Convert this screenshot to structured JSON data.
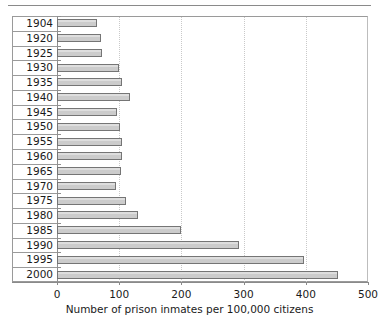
{
  "chart_data": {
    "type": "bar",
    "orientation": "horizontal",
    "title": "",
    "xlabel": "Number of prison inmates per 100,000 citizens",
    "ylabel": "",
    "xlim": [
      0,
      500
    ],
    "xticks": [
      0,
      100,
      200,
      300,
      400,
      500
    ],
    "xtick_labels": [
      "0",
      "100",
      "200",
      "300",
      "400",
      "500"
    ],
    "grid": "vertical-dotted",
    "gridlines": [
      100,
      200,
      300,
      400
    ],
    "legend": "none",
    "categories": [
      "1904",
      "1920",
      "1925",
      "1930",
      "1935",
      "1940",
      "1945",
      "1950",
      "1955",
      "1960",
      "1965",
      "1970",
      "1975",
      "1980",
      "1985",
      "1990",
      "1995",
      "2000"
    ],
    "values": [
      65,
      70,
      73,
      100,
      105,
      118,
      97,
      102,
      105,
      104,
      103,
      95,
      111,
      130,
      200,
      292,
      397,
      452
    ],
    "bar_color": "#cccccc",
    "bar_edge_color": "#757575"
  },
  "axis": {
    "x_label": "Number of prison inmates per 100,000 citizens",
    "ticks": [
      {
        "label": "0",
        "value": 0
      },
      {
        "label": "100",
        "value": 100
      },
      {
        "label": "200",
        "value": 200
      },
      {
        "label": "300",
        "value": 300
      },
      {
        "label": "400",
        "value": 400
      },
      {
        "label": "500",
        "value": 500
      }
    ]
  },
  "rows": [
    {
      "year": "1904",
      "value": 65
    },
    {
      "year": "1920",
      "value": 70
    },
    {
      "year": "1925",
      "value": 73
    },
    {
      "year": "1930",
      "value": 100
    },
    {
      "year": "1935",
      "value": 105
    },
    {
      "year": "1940",
      "value": 118
    },
    {
      "year": "1945",
      "value": 97
    },
    {
      "year": "1950",
      "value": 102
    },
    {
      "year": "1955",
      "value": 105
    },
    {
      "year": "1960",
      "value": 104
    },
    {
      "year": "1965",
      "value": 103
    },
    {
      "year": "1970",
      "value": 95
    },
    {
      "year": "1975",
      "value": 111
    },
    {
      "year": "1980",
      "value": 130
    },
    {
      "year": "1985",
      "value": 200
    },
    {
      "year": "1990",
      "value": 292
    },
    {
      "year": "1995",
      "value": 397
    },
    {
      "year": "2000",
      "value": 452
    }
  ]
}
